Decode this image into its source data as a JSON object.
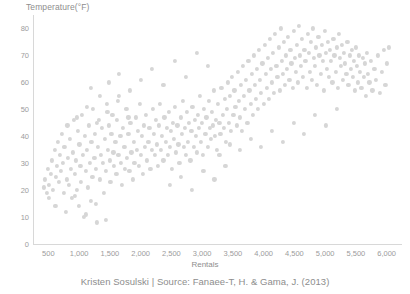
{
  "footer": {
    "caption": "Kristen Sosulski | Source: Fanaee-T, H. & Gama, J. (2013)"
  },
  "chart_data": {
    "type": "scatter",
    "title": "",
    "xlabel": "Rentals",
    "ylabel": "Temperature(°F)",
    "xlim": [
      250,
      6250
    ],
    "ylim": [
      0,
      85
    ],
    "grid": false,
    "legend": null,
    "marker_color": "#d6d6d6",
    "marker_size": 4.2,
    "xticks": [
      500,
      1000,
      1500,
      2000,
      2500,
      3000,
      3500,
      4000,
      4500,
      5000,
      5500,
      6000
    ],
    "xtick_labels": [
      "500",
      "1,000",
      "1,500",
      "2,000",
      "2,500",
      "3,000",
      "3,500",
      "4,000",
      "4,500",
      "5,000",
      "5,500",
      "6,000"
    ],
    "yticks": [
      0,
      10,
      20,
      30,
      40,
      50,
      60,
      70,
      80
    ],
    "ytick_labels": [
      "0",
      "10",
      "20",
      "30",
      "40",
      "50",
      "60",
      "70",
      "80"
    ],
    "points": [
      [
        431,
        21
      ],
      [
        441,
        24
      ],
      [
        470,
        19
      ],
      [
        490,
        28
      ],
      [
        506,
        22
      ],
      [
        510,
        17
      ],
      [
        545,
        26
      ],
      [
        560,
        31
      ],
      [
        580,
        20
      ],
      [
        605,
        35
      ],
      [
        623,
        25
      ],
      [
        640,
        29
      ],
      [
        655,
        38
      ],
      [
        670,
        23
      ],
      [
        683,
        33
      ],
      [
        705,
        27
      ],
      [
        720,
        41
      ],
      [
        738,
        30
      ],
      [
        750,
        19
      ],
      [
        762,
        36
      ],
      [
        795,
        24
      ],
      [
        810,
        44
      ],
      [
        822,
        32
      ],
      [
        840,
        22
      ],
      [
        856,
        39
      ],
      [
        870,
        28
      ],
      [
        888,
        17
      ],
      [
        900,
        34
      ],
      [
        915,
        46
      ],
      [
        930,
        26
      ],
      [
        948,
        31
      ],
      [
        960,
        20
      ],
      [
        975,
        42
      ],
      [
        990,
        14
      ],
      [
        1005,
        37
      ],
      [
        1020,
        29
      ],
      [
        1035,
        23
      ],
      [
        1050,
        48
      ],
      [
        1065,
        33
      ],
      [
        1080,
        10
      ],
      [
        1095,
        40
      ],
      [
        1110,
        27
      ],
      [
        1125,
        35
      ],
      [
        1140,
        21
      ],
      [
        1155,
        44
      ],
      [
        1170,
        30
      ],
      [
        1185,
        16
      ],
      [
        1200,
        38
      ],
      [
        1215,
        25
      ],
      [
        1230,
        50
      ],
      [
        1248,
        32
      ],
      [
        1260,
        41
      ],
      [
        1275,
        28
      ],
      [
        1290,
        8
      ],
      [
        1305,
        36
      ],
      [
        1320,
        46
      ],
      [
        1340,
        24
      ],
      [
        1355,
        33
      ],
      [
        1370,
        43
      ],
      [
        1385,
        30
      ],
      [
        1400,
        19
      ],
      [
        1418,
        39
      ],
      [
        1432,
        27
      ],
      [
        1448,
        52
      ],
      [
        1462,
        35
      ],
      [
        1478,
        44
      ],
      [
        1495,
        31
      ],
      [
        1510,
        23
      ],
      [
        1525,
        41
      ],
      [
        1540,
        48
      ],
      [
        1558,
        34
      ],
      [
        1572,
        29
      ],
      [
        1590,
        38
      ],
      [
        1605,
        26
      ],
      [
        1620,
        46
      ],
      [
        1638,
        33
      ],
      [
        1652,
        55
      ],
      [
        1670,
        40
      ],
      [
        1685,
        30
      ],
      [
        1700,
        22
      ],
      [
        1718,
        43
      ],
      [
        1735,
        36
      ],
      [
        1750,
        28
      ],
      [
        1768,
        50
      ],
      [
        1782,
        32
      ],
      [
        1800,
        41
      ],
      [
        1818,
        27
      ],
      [
        1835,
        45
      ],
      [
        1850,
        34
      ],
      [
        1868,
        24
      ],
      [
        1885,
        38
      ],
      [
        1900,
        30
      ],
      [
        1920,
        47
      ],
      [
        1938,
        35
      ],
      [
        1955,
        42
      ],
      [
        1970,
        29
      ],
      [
        1988,
        52
      ],
      [
        2005,
        33
      ],
      [
        2020,
        40
      ],
      [
        2038,
        26
      ],
      [
        2055,
        44
      ],
      [
        2072,
        36
      ],
      [
        2090,
        48
      ],
      [
        2108,
        31
      ],
      [
        2125,
        38
      ],
      [
        2142,
        43
      ],
      [
        2160,
        28
      ],
      [
        2178,
        35
      ],
      [
        2195,
        50
      ],
      [
        2212,
        41
      ],
      [
        2230,
        33
      ],
      [
        2248,
        46
      ],
      [
        2265,
        37
      ],
      [
        2282,
        29
      ],
      [
        2300,
        44
      ],
      [
        2318,
        52
      ],
      [
        2335,
        35
      ],
      [
        2352,
        40
      ],
      [
        2370,
        31
      ],
      [
        2388,
        47
      ],
      [
        2405,
        38
      ],
      [
        2422,
        43
      ],
      [
        2440,
        33
      ],
      [
        2458,
        49
      ],
      [
        2475,
        36
      ],
      [
        2492,
        42
      ],
      [
        2510,
        28
      ],
      [
        2528,
        45
      ],
      [
        2545,
        39
      ],
      [
        2562,
        51
      ],
      [
        2580,
        34
      ],
      [
        2598,
        44
      ],
      [
        2615,
        37
      ],
      [
        2632,
        30
      ],
      [
        2650,
        47
      ],
      [
        2668,
        41
      ],
      [
        2685,
        53
      ],
      [
        2702,
        36
      ],
      [
        2720,
        43
      ],
      [
        2738,
        33
      ],
      [
        2755,
        49
      ],
      [
        2772,
        38
      ],
      [
        2790,
        45
      ],
      [
        2808,
        31
      ],
      [
        2825,
        42
      ],
      [
        2842,
        51
      ],
      [
        2860,
        36
      ],
      [
        2878,
        46
      ],
      [
        2895,
        40
      ],
      [
        2912,
        34
      ],
      [
        2930,
        48
      ],
      [
        2948,
        43
      ],
      [
        2965,
        55
      ],
      [
        2982,
        38
      ],
      [
        3000,
        45
      ],
      [
        3018,
        33
      ],
      [
        3035,
        50
      ],
      [
        3052,
        41
      ],
      [
        3070,
        47
      ],
      [
        3088,
        36
      ],
      [
        3105,
        53
      ],
      [
        3122,
        43
      ],
      [
        3140,
        39
      ],
      [
        3158,
        49
      ],
      [
        3175,
        44
      ],
      [
        3192,
        57
      ],
      [
        3210,
        40
      ],
      [
        3228,
        46
      ],
      [
        3245,
        35
      ],
      [
        3262,
        52
      ],
      [
        3280,
        45
      ],
      [
        3298,
        41
      ],
      [
        3315,
        58
      ],
      [
        3332,
        48
      ],
      [
        3350,
        43
      ],
      [
        3368,
        54
      ],
      [
        3385,
        38
      ],
      [
        3402,
        50
      ],
      [
        3420,
        60
      ],
      [
        3438,
        45
      ],
      [
        3455,
        55
      ],
      [
        3472,
        42
      ],
      [
        3490,
        62
      ],
      [
        3508,
        48
      ],
      [
        3525,
        57
      ],
      [
        3542,
        51
      ],
      [
        3560,
        44
      ],
      [
        3578,
        64
      ],
      [
        3595,
        53
      ],
      [
        3612,
        47
      ],
      [
        3630,
        59
      ],
      [
        3648,
        42
      ],
      [
        3665,
        66
      ],
      [
        3682,
        55
      ],
      [
        3700,
        50
      ],
      [
        3718,
        61
      ],
      [
        3735,
        45
      ],
      [
        3752,
        68
      ],
      [
        3770,
        57
      ],
      [
        3788,
        52
      ],
      [
        3805,
        63
      ],
      [
        3822,
        48
      ],
      [
        3840,
        70
      ],
      [
        3858,
        59
      ],
      [
        3875,
        54
      ],
      [
        3892,
        65
      ],
      [
        3910,
        50
      ],
      [
        3928,
        72
      ],
      [
        3945,
        61
      ],
      [
        3962,
        56
      ],
      [
        3980,
        67
      ],
      [
        3998,
        52
      ],
      [
        4015,
        74
      ],
      [
        4032,
        63
      ],
      [
        4050,
        58
      ],
      [
        4068,
        69
      ],
      [
        4085,
        54
      ],
      [
        4102,
        76
      ],
      [
        4120,
        65
      ],
      [
        4138,
        60
      ],
      [
        4155,
        71
      ],
      [
        4172,
        56
      ],
      [
        4190,
        78
      ],
      [
        4208,
        66
      ],
      [
        4225,
        62
      ],
      [
        4242,
        73
      ],
      [
        4260,
        57
      ],
      [
        4278,
        80
      ],
      [
        4295,
        68
      ],
      [
        4312,
        63
      ],
      [
        4330,
        75
      ],
      [
        4348,
        59
      ],
      [
        4365,
        70
      ],
      [
        4382,
        65
      ],
      [
        4400,
        77
      ],
      [
        4418,
        61
      ],
      [
        4435,
        72
      ],
      [
        4452,
        67
      ],
      [
        4470,
        58
      ],
      [
        4488,
        79
      ],
      [
        4505,
        69
      ],
      [
        4522,
        64
      ],
      [
        4540,
        74
      ],
      [
        4558,
        60
      ],
      [
        4575,
        81
      ],
      [
        4592,
        70
      ],
      [
        4610,
        66
      ],
      [
        4628,
        76
      ],
      [
        4645,
        62
      ],
      [
        4662,
        72
      ],
      [
        4680,
        68
      ],
      [
        4698,
        58
      ],
      [
        4715,
        78
      ],
      [
        4732,
        71
      ],
      [
        4750,
        64
      ],
      [
        4768,
        75
      ],
      [
        4785,
        61
      ],
      [
        4802,
        80
      ],
      [
        4820,
        69
      ],
      [
        4838,
        66
      ],
      [
        4855,
        73
      ],
      [
        4872,
        59
      ],
      [
        4890,
        77
      ],
      [
        4908,
        70
      ],
      [
        4925,
        63
      ],
      [
        4942,
        74
      ],
      [
        4960,
        68
      ],
      [
        4978,
        57
      ],
      [
        4995,
        79
      ],
      [
        5012,
        71
      ],
      [
        5030,
        65
      ],
      [
        5048,
        75
      ],
      [
        5065,
        62
      ],
      [
        5082,
        72
      ],
      [
        5100,
        68
      ],
      [
        5118,
        60
      ],
      [
        5135,
        76
      ],
      [
        5152,
        70
      ],
      [
        5170,
        64
      ],
      [
        5188,
        73
      ],
      [
        5205,
        58
      ],
      [
        5222,
        78
      ],
      [
        5240,
        69
      ],
      [
        5258,
        66
      ],
      [
        5275,
        74
      ],
      [
        5292,
        61
      ],
      [
        5310,
        71
      ],
      [
        5328,
        67
      ],
      [
        5345,
        63
      ],
      [
        5362,
        75
      ],
      [
        5380,
        59
      ],
      [
        5398,
        70
      ],
      [
        5415,
        65
      ],
      [
        5432,
        72
      ],
      [
        5450,
        62
      ],
      [
        5468,
        68
      ],
      [
        5485,
        57
      ],
      [
        5502,
        73
      ],
      [
        5520,
        66
      ],
      [
        5538,
        60
      ],
      [
        5555,
        70
      ],
      [
        5572,
        64
      ],
      [
        5590,
        58
      ],
      [
        5608,
        69
      ],
      [
        5625,
        62
      ],
      [
        5642,
        67
      ],
      [
        5660,
        55
      ],
      [
        5680,
        71
      ],
      [
        5700,
        63
      ],
      [
        5720,
        60
      ],
      [
        5745,
        68
      ],
      [
        5770,
        57
      ],
      [
        5800,
        65
      ],
      [
        5830,
        61
      ],
      [
        5860,
        70
      ],
      [
        5890,
        56
      ],
      [
        5920,
        64
      ],
      [
        5950,
        72
      ],
      [
        5980,
        59
      ],
      [
        6010,
        67
      ],
      [
        6040,
        73
      ],
      [
        1195,
        58
      ],
      [
        1340,
        55
      ],
      [
        1480,
        60
      ],
      [
        1650,
        63
      ],
      [
        1820,
        57
      ],
      [
        2010,
        61
      ],
      [
        2190,
        65
      ],
      [
        2370,
        59
      ],
      [
        2560,
        68
      ],
      [
        2740,
        62
      ],
      [
        2920,
        71
      ],
      [
        3100,
        66
      ],
      [
        3280,
        33
      ],
      [
        3450,
        37
      ],
      [
        3620,
        35
      ],
      [
        3790,
        39
      ],
      [
        3960,
        36
      ],
      [
        4140,
        42
      ],
      [
        4310,
        38
      ],
      [
        4490,
        45
      ],
      [
        4660,
        41
      ],
      [
        4840,
        48
      ],
      [
        5010,
        44
      ],
      [
        5190,
        50
      ],
      [
        960,
        47
      ],
      [
        1120,
        51
      ],
      [
        1290,
        45
      ],
      [
        1460,
        49
      ],
      [
        1630,
        53
      ],
      [
        1800,
        47
      ],
      [
        2480,
        22
      ],
      [
        2660,
        25
      ],
      [
        2840,
        20
      ],
      [
        3020,
        27
      ],
      [
        3200,
        24
      ],
      [
        3380,
        29
      ],
      [
        615,
        14
      ],
      [
        780,
        12
      ],
      [
        935,
        18
      ],
      [
        1115,
        11
      ],
      [
        1270,
        15
      ],
      [
        1430,
        9
      ]
    ]
  }
}
